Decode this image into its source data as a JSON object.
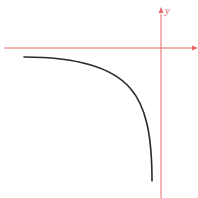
{
  "figure": {
    "axes": {
      "x_label": "",
      "y_label": "y",
      "color": "#e8686a"
    },
    "curve": {
      "description": "Decreasing concave curve in the third quadrant approaching the x-axis on the left and plunging downward near the y-axis",
      "color": "#2a2a2a"
    }
  }
}
